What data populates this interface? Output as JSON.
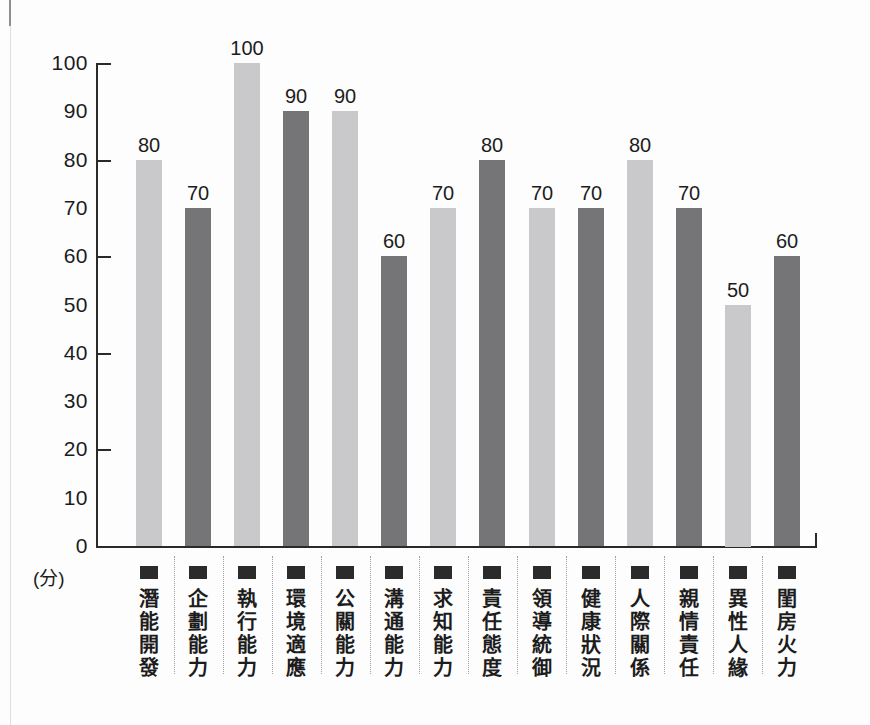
{
  "chart_data": {
    "type": "bar",
    "title": "",
    "unit_label": "(分)",
    "categories": [
      "潛能開發",
      "企劃能力",
      "執行能力",
      "環境適應",
      "公關能力",
      "溝通能力",
      "求知能力",
      "責任態度",
      "領導統御",
      "健康狀況",
      "人際關係",
      "親情責任",
      "異性人緣",
      "閨房火力"
    ],
    "values": [
      80,
      70,
      100,
      90,
      90,
      60,
      70,
      80,
      70,
      70,
      80,
      70,
      50,
      60
    ],
    "bar_color_pattern": [
      "light",
      "dark",
      "light",
      "dark",
      "light",
      "dark",
      "light",
      "dark",
      "light",
      "dark",
      "light",
      "dark",
      "light",
      "dark"
    ],
    "colors": {
      "light_bar": "#c9c9cb",
      "dark_bar": "#757578",
      "axis": "#2a2a2a",
      "text": "#1c1c1c",
      "category_chip": "#2b2b2b",
      "separator_dotted": "#9f9f9f"
    },
    "y_axis": {
      "min": 0,
      "max": 100,
      "label_step": 10,
      "tick_step": 20,
      "tick_labels": [
        "0",
        "10",
        "20",
        "30",
        "40",
        "50",
        "60",
        "70",
        "80",
        "90",
        "100"
      ]
    },
    "value_labels_shown": true,
    "grid": false,
    "legend_position": "none",
    "xlabel": "",
    "ylabel": "(分)"
  }
}
